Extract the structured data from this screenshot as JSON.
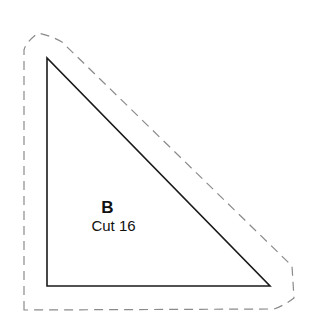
{
  "piece": {
    "letter": "B",
    "cut_instruction": "Cut 16",
    "shape": "right-triangle",
    "line_color": "#1a1a1a",
    "seam_allowance_color": "#8a8a8a"
  }
}
